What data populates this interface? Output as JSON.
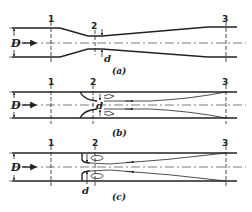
{
  "figure": {
    "panels": [
      {
        "id": "a",
        "caption": "(a)",
        "device": "venturi tube",
        "stations": [
          "1",
          "2",
          "3"
        ],
        "labels": {
          "pipe_diameter": "D",
          "throat_diameter": "d"
        }
      },
      {
        "id": "b",
        "caption": "(b)",
        "device": "flow nozzle",
        "stations": [
          "1",
          "2",
          "3"
        ],
        "labels": {
          "pipe_diameter": "D",
          "throat_diameter": "d"
        }
      },
      {
        "id": "c",
        "caption": "(c)",
        "device": "orifice plate",
        "stations": [
          "1",
          "2",
          "3"
        ],
        "labels": {
          "pipe_diameter": "D",
          "throat_diameter": "d"
        }
      }
    ],
    "icons": [
      "flow-arrow-icon",
      "recirculation-eddy-icon",
      "dimension-arrow-icon"
    ]
  }
}
